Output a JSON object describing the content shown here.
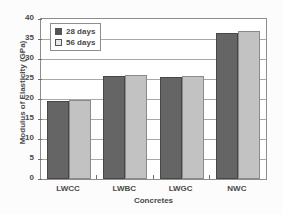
{
  "chart_data": {
    "type": "bar",
    "title": "",
    "subtitle": "",
    "xlabel": "Concretes",
    "ylabel": "Modulus of Elasticity (GPa)",
    "categories": [
      "LWCC",
      "LWBC",
      "LWGC",
      "NWC"
    ],
    "series": [
      {
        "name": "28 days",
        "values": [
          19.5,
          25.8,
          25.5,
          36.5
        ],
        "color": "#656565"
      },
      {
        "name": "56 days",
        "values": [
          19.7,
          26.1,
          25.8,
          37.0
        ],
        "color": "#c2c2c2"
      }
    ],
    "ylim": [
      0,
      40
    ],
    "ytick_labels": [
      "40",
      "35",
      "30",
      "25",
      "20",
      "15",
      "10",
      "5",
      "0"
    ],
    "ytick_values": [
      40,
      35,
      30,
      25,
      20,
      15,
      10,
      5,
      0
    ],
    "grid": true,
    "legend_position": "top-left",
    "legend_entries": [
      "28 days",
      "56 days"
    ]
  },
  "legend": {
    "items": [
      {
        "label": "28 days"
      },
      {
        "label": "56 days"
      }
    ]
  },
  "axes": {
    "y_title": "Modulus of Elasticity (GPa)",
    "x_title": "Concretes"
  }
}
